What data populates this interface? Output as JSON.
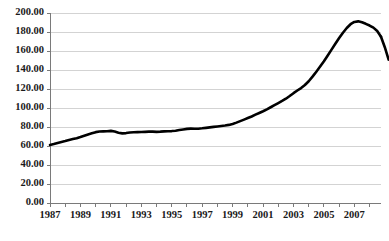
{
  "chart_data": {
    "type": "line",
    "title": "",
    "subtitle": "",
    "xlabel": "",
    "ylabel": "",
    "grid": "horizontal",
    "legend": "none",
    "xlim": [
      1987.0,
      2008.75
    ],
    "ylim": [
      0.0,
      200.0
    ],
    "y_tick_step": 20.0,
    "y_tick_labels": [
      "0.00",
      "20.00",
      "40.00",
      "60.00",
      "80.00",
      "100.00",
      "120.00",
      "140.00",
      "160.00",
      "180.00",
      "200.00"
    ],
    "y_tick_values": [
      0,
      20,
      40,
      60,
      80,
      100,
      120,
      140,
      160,
      180,
      200
    ],
    "x_tick_labels": [
      "1987",
      "1989",
      "1991",
      "1993",
      "1995",
      "1997",
      "1999",
      "2001",
      "2003",
      "2005",
      "2007"
    ],
    "x_tick_values": [
      1987,
      1989,
      1991,
      1993,
      1995,
      1997,
      1999,
      2001,
      2003,
      2005,
      2007
    ],
    "x_minor_tick_values": [
      1987,
      1988,
      1989,
      1990,
      1991,
      1992,
      1993,
      1994,
      1995,
      1996,
      1997,
      1998,
      1999,
      2000,
      2001,
      2002,
      2003,
      2004,
      2005,
      2006,
      2007,
      2008
    ],
    "series": [
      {
        "name": "Index",
        "color": "#000000",
        "x": [
          1987.0,
          1987.25,
          1987.5,
          1987.75,
          1988.0,
          1988.25,
          1988.5,
          1988.75,
          1989.0,
          1989.25,
          1989.5,
          1989.75,
          1990.0,
          1990.25,
          1990.5,
          1990.75,
          1991.0,
          1991.25,
          1991.5,
          1991.75,
          1992.0,
          1992.25,
          1992.5,
          1992.75,
          1993.0,
          1993.25,
          1993.5,
          1993.75,
          1994.0,
          1994.25,
          1994.5,
          1994.75,
          1995.0,
          1995.25,
          1995.5,
          1995.75,
          1996.0,
          1996.25,
          1996.5,
          1996.75,
          1997.0,
          1997.25,
          1997.5,
          1997.75,
          1998.0,
          1998.25,
          1998.5,
          1998.75,
          1999.0,
          1999.25,
          1999.5,
          1999.75,
          2000.0,
          2000.25,
          2000.5,
          2000.75,
          2001.0,
          2001.25,
          2001.5,
          2001.75,
          2002.0,
          2002.25,
          2002.5,
          2002.75,
          2003.0,
          2003.25,
          2003.5,
          2003.75,
          2004.0,
          2004.25,
          2004.5,
          2004.75,
          2005.0,
          2005.25,
          2005.5,
          2005.75,
          2006.0,
          2006.25,
          2006.5,
          2006.75,
          2007.0,
          2007.25,
          2007.5,
          2007.75,
          2008.0,
          2008.25,
          2008.5,
          2008.75
        ],
        "values": [
          61.0,
          62.0,
          63.2,
          64.3,
          65.3,
          66.4,
          67.3,
          68.2,
          69.4,
          70.8,
          72.2,
          73.4,
          74.6,
          75.2,
          75.4,
          75.6,
          75.9,
          75.2,
          74.0,
          73.3,
          73.6,
          74.2,
          74.5,
          74.6,
          74.7,
          74.9,
          75.1,
          75.1,
          74.9,
          75.1,
          75.4,
          75.6,
          75.7,
          76.1,
          76.8,
          77.4,
          78.0,
          78.3,
          78.1,
          78.2,
          78.6,
          79.1,
          79.6,
          80.1,
          80.6,
          81.1,
          81.6,
          82.2,
          83.2,
          84.6,
          86.2,
          87.8,
          89.4,
          91.1,
          93.0,
          94.8,
          96.6,
          98.6,
          100.8,
          103.0,
          105.2,
          107.4,
          109.8,
          112.6,
          115.6,
          118.4,
          121.0,
          124.2,
          128.2,
          133.0,
          138.2,
          143.6,
          149.2,
          155.2,
          161.4,
          167.6,
          173.6,
          179.2,
          184.2,
          188.2,
          190.6,
          191.2,
          190.2,
          188.6,
          186.8,
          184.6,
          181.0,
          175.0
        ]
      },
      {
        "name": "Index tail",
        "color": "#000000",
        "x": [
          2008.75,
          2009.0,
          2009.25
        ],
        "values": [
          175.0,
          164.0,
          151.0
        ]
      }
    ]
  },
  "plot": {
    "left": 50,
    "right": 381,
    "top": 13,
    "bottom": 203
  }
}
